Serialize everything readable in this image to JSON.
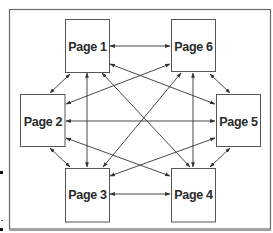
{
  "diagram": {
    "type": "site-navigation-structure",
    "colors": {
      "background": "#ffffff",
      "frame": "#6a6a6a",
      "box_border": "#555555",
      "arrow": "#333333",
      "text": "#2a2a2a"
    },
    "nodes": [
      {
        "id": "p1",
        "label": "Page 1"
      },
      {
        "id": "p2",
        "label": "Page 2"
      },
      {
        "id": "p3",
        "label": "Page 3"
      },
      {
        "id": "p4",
        "label": "Page 4"
      },
      {
        "id": "p5",
        "label": "Page 5"
      },
      {
        "id": "p6",
        "label": "Page 6"
      }
    ],
    "edges": [
      {
        "from": "p1",
        "to": "p6",
        "direction": "both"
      },
      {
        "from": "p3",
        "to": "p4",
        "direction": "both"
      },
      {
        "from": "p2",
        "to": "p5",
        "direction": "both"
      },
      {
        "from": "p1",
        "to": "p3",
        "direction": "both"
      },
      {
        "from": "p6",
        "to": "p4",
        "direction": "both"
      },
      {
        "from": "p1",
        "to": "p2",
        "direction": "both"
      },
      {
        "from": "p6",
        "to": "p5",
        "direction": "both"
      },
      {
        "from": "p2",
        "to": "p3",
        "direction": "both"
      },
      {
        "from": "p5",
        "to": "p4",
        "direction": "both"
      },
      {
        "from": "p1",
        "to": "p5",
        "direction": "both"
      },
      {
        "from": "p6",
        "to": "p2",
        "direction": "both"
      },
      {
        "from": "p2",
        "to": "p4",
        "direction": "both"
      },
      {
        "from": "p5",
        "to": "p3",
        "direction": "both"
      },
      {
        "from": "p1",
        "to": "p4",
        "direction": "both"
      },
      {
        "from": "p6",
        "to": "p3",
        "direction": "both"
      }
    ]
  }
}
